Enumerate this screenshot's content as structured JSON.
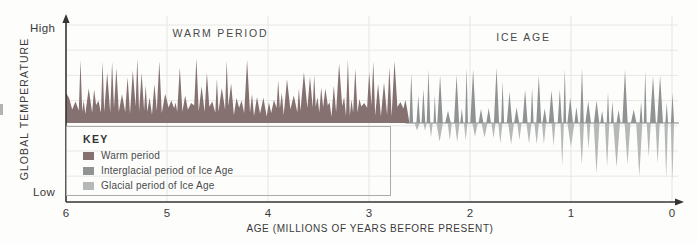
{
  "figure": {
    "y_axis": {
      "top_label": "High",
      "bottom_label": "Low",
      "title": "GLOBAL TEMPERATURE"
    },
    "x_axis": {
      "title": "AGE (MILLIONS OF YEARS BEFORE PRESENT)"
    }
  },
  "key": {
    "title": "KEY",
    "items": [
      {
        "label": "Warm period",
        "color": "#857170"
      },
      {
        "label": "Interglacial period of Ice Age",
        "color": "#8f9394"
      },
      {
        "label": "Glacial period of Ice Age",
        "color": "#b4b8b6"
      }
    ]
  },
  "chart_data": {
    "type": "area",
    "title": "",
    "xlabel": "AGE (MILLIONS OF YEARS BEFORE PRESENT)",
    "ylabel": "GLOBAL TEMPERATURE",
    "x_ticks": [
      6,
      5,
      4,
      3,
      2,
      1,
      0
    ],
    "x_range": [
      6,
      0
    ],
    "y_axis_qualitative": {
      "top": "High",
      "bottom": "Low"
    },
    "grid": "faint gray grid, vertical line at each 1-Myr tick, 7 horizontal lines",
    "annotations": [
      {
        "text": "WARM PERIOD",
        "x_myr": 4.47
      },
      {
        "text": "ICE AGE",
        "x_myr": 1.47
      }
    ],
    "seed": 13,
    "regions": [
      {
        "name": "Warm period",
        "color": "#857170",
        "side": "above-baseline",
        "style": "connected-jagged-area",
        "from_myr": 6.0,
        "to_myr": 2.6,
        "spike_width": [
          3,
          7
        ],
        "amp_min": 20,
        "amp_max": 66,
        "valley_min": 6,
        "valley_max": 18,
        "meaning": "continuously high, strongly fluctuating temperature until ~2.6 Myr ago"
      },
      {
        "name": "Interglacial period of Ice Age",
        "color": "#8f9394",
        "side": "above-baseline",
        "style": "separate-spikes",
        "from_myr": 2.62,
        "to_myr": 0.0,
        "amp": [
          12,
          56
        ],
        "width": [
          2.5,
          6
        ],
        "gap": [
          1,
          3.5
        ],
        "meaning": "brief warm excursions during the Ice Age, 2.6 Myr ago to present"
      },
      {
        "name": "Glacial period of Ice Age",
        "color": "#b4b8b6",
        "side": "below-baseline",
        "style": "separate-spikes",
        "from_myr": 2.55,
        "to_myr": 0.0,
        "width": [
          3,
          7
        ],
        "gap": [
          2.5,
          6
        ],
        "depth_min": 7,
        "depth_max": 60,
        "depth_trend": "cold excursions deepen toward the present",
        "meaning": "cold glacial dips growing more extreme approaching 0 Myr"
      }
    ]
  }
}
